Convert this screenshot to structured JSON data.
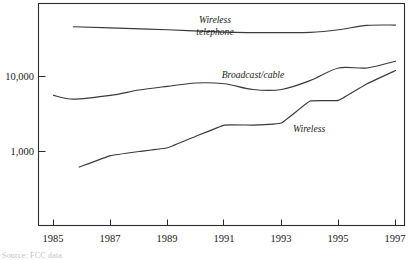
{
  "chart_data": {
    "type": "line",
    "title": "",
    "subtitle": "",
    "xlabel": "",
    "ylabel": "",
    "yscale": "log",
    "ylim": [
      300,
      70000
    ],
    "xlim": [
      1984.5,
      1997.5
    ],
    "grid": false,
    "legend_position": "inline-labels",
    "x_tick_labels": [
      "1985",
      "1987",
      "1989",
      "1991",
      "1993",
      "1995",
      "1997"
    ],
    "x_tick_values": [
      1985,
      1987,
      1989,
      1991,
      1993,
      1995,
      1997
    ],
    "y_tick_labels": [
      "10,000",
      "1,000"
    ],
    "y_tick_values": [
      10000,
      1000
    ],
    "series": [
      {
        "name": "Wireless telephone",
        "label": "Wireless telephone",
        "label_line1": "Wireless",
        "label_line2": "telephone",
        "x": [
          1985.7,
          1987,
          1989,
          1991,
          1992,
          1993,
          1994,
          1995,
          1996,
          1997
        ],
        "values": [
          46000,
          44500,
          42000,
          39000,
          38500,
          38500,
          38800,
          42000,
          48000,
          48500
        ]
      },
      {
        "name": "Broadcast/cable",
        "label": "Broadcast/cable",
        "x": [
          1985,
          1985.7,
          1987,
          1988,
          1989,
          1990,
          1991,
          1992,
          1993,
          1994,
          1995,
          1996,
          1997
        ],
        "values": [
          5600,
          5000,
          5600,
          6600,
          7400,
          8200,
          8000,
          6700,
          6700,
          8800,
          13000,
          13000,
          16000
        ]
      },
      {
        "name": "Wireless",
        "label": "Wireless",
        "x": [
          1985.9,
          1987,
          1988,
          1989,
          1990,
          1991,
          1992,
          1993,
          1994,
          1995,
          1996,
          1997
        ],
        "values": [
          620,
          880,
          1000,
          1120,
          1600,
          2250,
          2250,
          2400,
          4700,
          4800,
          8000,
          12000
        ]
      }
    ],
    "footnote": "Source: FCC data"
  }
}
